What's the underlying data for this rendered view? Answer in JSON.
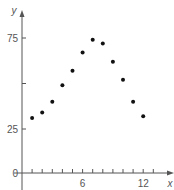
{
  "chart_data": {
    "type": "scatter",
    "title": "",
    "xlabel": "x",
    "ylabel": "y",
    "xlim": [
      0,
      15
    ],
    "ylim": [
      0,
      80
    ],
    "x_ticks": [
      1,
      2,
      3,
      4,
      5,
      6,
      7,
      8,
      9,
      10,
      11,
      12,
      13
    ],
    "x_tick_labels": [
      {
        "value": 6,
        "label": "6"
      },
      {
        "value": 12,
        "label": "12"
      }
    ],
    "y_ticks": [
      25,
      50,
      75
    ],
    "y_tick_labels": [
      {
        "value": 0,
        "label": "0"
      },
      {
        "value": 25,
        "label": "25"
      },
      {
        "value": 75,
        "label": "75"
      }
    ],
    "grid": false,
    "legend": null,
    "series": [
      {
        "name": "data",
        "x": [
          1,
          2,
          3,
          4,
          5,
          6,
          7,
          8,
          9,
          10,
          11,
          12
        ],
        "y": [
          31,
          34,
          40,
          49,
          57,
          67,
          74,
          72,
          62,
          52,
          40,
          32
        ]
      }
    ],
    "colors": {
      "axis": "#555555",
      "point": "#111111"
    }
  }
}
